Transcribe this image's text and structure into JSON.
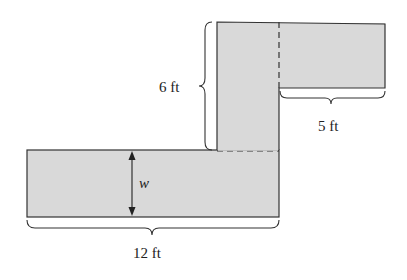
{
  "diagram": {
    "type": "composite-shape-dimensions",
    "fill_color": "#d9d9d9",
    "stroke_color": "#333333",
    "labels": {
      "height": "6 ft",
      "top_width": "5 ft",
      "bottom_width": "12 ft",
      "width_var": "w"
    },
    "regions": [
      {
        "name": "bottom-rectangle"
      },
      {
        "name": "vertical-column"
      },
      {
        "name": "top-right-rectangle"
      }
    ]
  }
}
